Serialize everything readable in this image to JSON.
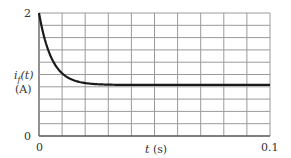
{
  "chart_data": {
    "type": "line",
    "title": "",
    "xlabel": "t (s)",
    "ylabel": "i_f(t) (A)",
    "ylabel_line1": "i_f(t)",
    "ylabel_line2": "(A)",
    "xlim": [
      0,
      0.1
    ],
    "ylim": [
      0,
      2
    ],
    "grid": true,
    "grid_divisions_x": 10,
    "grid_divisions_y": 10,
    "x_tick_labels": [
      "0",
      "0.1"
    ],
    "y_tick_labels": [
      "0",
      "2"
    ],
    "series": [
      {
        "name": "i_f(t)",
        "model": "0.83 + 1.17*exp(-t/0.0055)",
        "x": [
          0,
          0.0025,
          0.005,
          0.0075,
          0.01,
          0.015,
          0.02,
          0.03,
          0.04,
          0.05,
          0.06,
          0.07,
          0.08,
          0.09,
          0.1
        ],
        "y": [
          2.0,
          1.57,
          1.3,
          1.13,
          1.02,
          0.91,
          0.86,
          0.83,
          0.83,
          0.83,
          0.83,
          0.83,
          0.83,
          0.83,
          0.83
        ]
      }
    ],
    "legend": null
  },
  "labels": {
    "y_top": "2",
    "y_bottom": "0",
    "x_left": "0",
    "x_right": "0.1",
    "x_axis_var": "t",
    "x_axis_unit": "(s)",
    "y_axis_var": "i",
    "y_axis_sub": "f",
    "y_axis_arg": "(t)",
    "y_axis_unit": "(A)"
  },
  "colors": {
    "grid": "#9a9a9a",
    "axis": "#555555",
    "curve": "#1a1a1a"
  }
}
